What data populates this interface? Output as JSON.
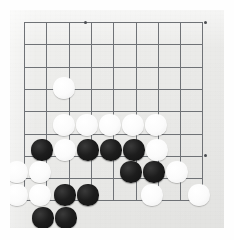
{
  "image": {
    "subject": "go-board-position",
    "width": 234,
    "height": 240,
    "description": "Photograph of a paper Go board showing a corner position with black and white stones"
  },
  "board": {
    "surface_color": "#eeeeec",
    "line_color": "#6f7276",
    "star_point_color": "#4a4d51",
    "black_stone_color": "#1d1d1d",
    "white_stone_color": "#fbfbfb",
    "origin_x": 24,
    "origin_y": 22,
    "cell_size": 22.3,
    "cols": 9,
    "rows": 9,
    "stone_radius": 10.6,
    "grid_lines_h": [
      22,
      44.3,
      66.6,
      88.9,
      111.2,
      133.5,
      155.8,
      178.1,
      200.4
    ],
    "grid_lines_v": [
      24,
      46.3,
      68.6,
      90.9,
      113.2,
      135.5,
      157.8,
      180.1,
      202.4
    ],
    "star_points": [
      {
        "x": 85,
        "y": 22
      },
      {
        "x": 205,
        "y": 22
      },
      {
        "x": 205,
        "y": 155
      }
    ]
  },
  "stones": [
    {
      "id": "w1",
      "color": "white",
      "cx": 64,
      "cy": 88
    },
    {
      "id": "w2",
      "color": "white",
      "cx": 64,
      "cy": 125
    },
    {
      "id": "w3",
      "color": "white",
      "cx": 87,
      "cy": 125
    },
    {
      "id": "w4",
      "color": "white",
      "cx": 110,
      "cy": 125
    },
    {
      "id": "w5",
      "color": "white",
      "cx": 133,
      "cy": 125
    },
    {
      "id": "w6",
      "color": "white",
      "cx": 156,
      "cy": 125
    },
    {
      "id": "b1",
      "color": "black",
      "cx": 42,
      "cy": 150
    },
    {
      "id": "w7",
      "color": "white",
      "cx": 65,
      "cy": 150
    },
    {
      "id": "b2",
      "color": "black",
      "cx": 88,
      "cy": 150
    },
    {
      "id": "b3",
      "color": "black",
      "cx": 111,
      "cy": 150
    },
    {
      "id": "b4",
      "color": "black",
      "cx": 134,
      "cy": 150
    },
    {
      "id": "w8",
      "color": "white",
      "cx": 157,
      "cy": 150
    },
    {
      "id": "w9",
      "color": "white",
      "cx": 17,
      "cy": 172
    },
    {
      "id": "w10",
      "color": "white",
      "cx": 40,
      "cy": 172
    },
    {
      "id": "b5",
      "color": "black",
      "cx": 131,
      "cy": 172
    },
    {
      "id": "b6",
      "color": "black",
      "cx": 154,
      "cy": 172
    },
    {
      "id": "w11",
      "color": "white",
      "cx": 177,
      "cy": 172
    },
    {
      "id": "w12",
      "color": "white",
      "cx": 17,
      "cy": 195
    },
    {
      "id": "w13",
      "color": "white",
      "cx": 40,
      "cy": 195
    },
    {
      "id": "b7",
      "color": "black",
      "cx": 65,
      "cy": 195
    },
    {
      "id": "b8",
      "color": "black",
      "cx": 88,
      "cy": 195
    },
    {
      "id": "w14",
      "color": "white",
      "cx": 152,
      "cy": 195
    },
    {
      "id": "w15",
      "color": "white",
      "cx": 199,
      "cy": 195
    },
    {
      "id": "b9",
      "color": "black",
      "cx": 43,
      "cy": 218
    },
    {
      "id": "b10",
      "color": "black",
      "cx": 66,
      "cy": 218
    }
  ]
}
